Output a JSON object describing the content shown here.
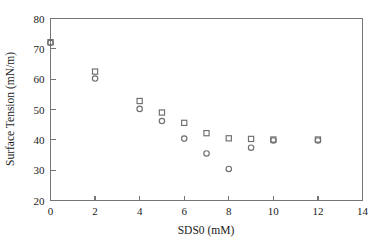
{
  "chart_data": {
    "type": "scatter",
    "title": "",
    "xlabel": "SDS0 (mM)",
    "ylabel": "Surface Tension (mN/m)",
    "xlim": [
      0,
      14
    ],
    "ylim": [
      20,
      80
    ],
    "xticks": [
      0,
      2,
      4,
      6,
      8,
      10,
      12,
      14
    ],
    "yticks": [
      20,
      30,
      40,
      50,
      60,
      70,
      80
    ],
    "xtick_labels": [
      "0",
      "2",
      "4",
      "6",
      "8",
      "10",
      "12",
      "14"
    ],
    "ytick_labels": [
      "20",
      "30",
      "40",
      "50",
      "60",
      "70",
      "80"
    ],
    "grid": false,
    "legend": "none",
    "marker_color": "#6e6e6e",
    "series": [
      {
        "name": "square-series",
        "marker": "square",
        "x": [
          0,
          2,
          4,
          5,
          6,
          7,
          8,
          9,
          10,
          12
        ],
        "y": [
          72.2,
          62.5,
          52.8,
          49.0,
          45.6,
          42.2,
          40.5,
          40.3,
          40.1,
          40.1
        ]
      },
      {
        "name": "circle-series",
        "marker": "circle",
        "x": [
          0,
          2,
          4,
          5,
          6,
          7,
          8,
          9,
          10,
          12
        ],
        "y": [
          72.0,
          60.2,
          50.2,
          46.2,
          40.4,
          35.5,
          30.4,
          37.4,
          39.8,
          39.8
        ]
      }
    ]
  }
}
